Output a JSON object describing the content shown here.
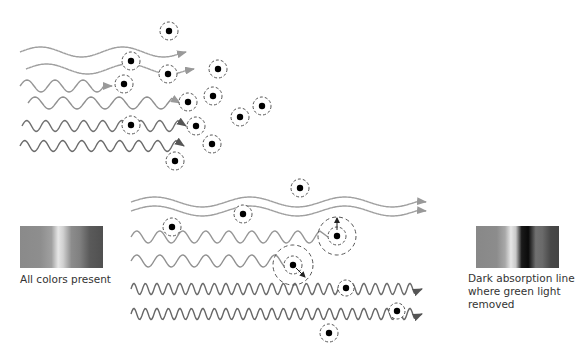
{
  "diagram": {
    "colors": {
      "wave_light": "#a0a0a0",
      "wave_mid": "#8a8a8a",
      "wave_dark": "#6a6a6a",
      "atom": "#000000",
      "orbit": "#555555"
    },
    "left_spectrum": {
      "icon": "continuous-spectrum",
      "caption": "All colors present"
    },
    "right_spectrum": {
      "icon": "absorption-spectrum",
      "caption_lines": [
        "Dark absorption line",
        "where green light",
        "removed"
      ]
    }
  }
}
